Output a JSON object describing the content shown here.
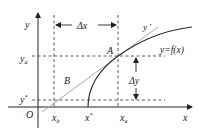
{
  "diagram": {
    "colors": {
      "axis": "#222222",
      "dashed": "#333333",
      "curve": "#2a2a2a",
      "tangent": "#a8a8a8",
      "text": "#222222"
    },
    "labels": {
      "y_axis": "y",
      "x_axis": "x",
      "origin": "O",
      "point_a": "A",
      "point_b": "B",
      "y_a": "y",
      "y_a_sub": "a",
      "y_star": "y",
      "y_star_sup": "*",
      "x_b": "x",
      "x_b_sub": "b",
      "x_star": "x",
      "x_star_sup": "*",
      "x_a": "x",
      "x_a_sub": "a",
      "delta_x": "Δx",
      "delta_y": "Δy",
      "tangent": "y '",
      "curve": "y=f(x)"
    }
  }
}
